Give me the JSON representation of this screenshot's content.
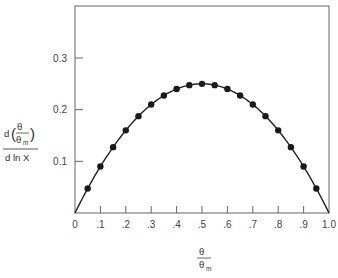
{
  "chart_data": {
    "type": "line",
    "title": "",
    "xlabel": "θ / θm",
    "ylabel": "d(θ/θm) / d ln X",
    "xlim": [
      0,
      1.0
    ],
    "ylim": [
      0,
      0.4
    ],
    "grid": false,
    "legend": null,
    "x_ticks": [
      "0",
      ".1",
      ".2",
      ".3",
      ".4",
      ".5",
      ".6",
      ".7",
      ".8",
      ".9",
      "1.0"
    ],
    "y_ticks": [
      "0.1",
      "0.2",
      "0.3"
    ],
    "series": [
      {
        "name": "theoretical curve",
        "style": "solid line",
        "x": [
          0,
          0.05,
          0.1,
          0.15,
          0.2,
          0.25,
          0.3,
          0.35,
          0.4,
          0.45,
          0.5,
          0.55,
          0.6,
          0.65,
          0.7,
          0.75,
          0.8,
          0.85,
          0.9,
          0.95,
          1.0
        ],
        "y": [
          0,
          0.0475,
          0.09,
          0.1275,
          0.16,
          0.1875,
          0.21,
          0.2275,
          0.24,
          0.2475,
          0.25,
          0.2475,
          0.24,
          0.2275,
          0.21,
          0.1875,
          0.16,
          0.1275,
          0.09,
          0.0475,
          0
        ]
      },
      {
        "name": "data points",
        "style": "filled circles",
        "x": [
          0.05,
          0.1,
          0.15,
          0.2,
          0.25,
          0.3,
          0.35,
          0.4,
          0.45,
          0.5,
          0.55,
          0.6,
          0.65,
          0.7,
          0.75,
          0.8,
          0.85,
          0.9,
          0.95
        ],
        "y": [
          0.0475,
          0.09,
          0.1275,
          0.16,
          0.1875,
          0.21,
          0.2275,
          0.24,
          0.2475,
          0.25,
          0.2475,
          0.24,
          0.2275,
          0.21,
          0.1875,
          0.16,
          0.1275,
          0.09,
          0.0475
        ]
      }
    ]
  },
  "labels": {
    "y_numer_d": "d",
    "y_theta": "θ",
    "y_theta_m": "θ",
    "y_m_sub": "m",
    "y_denom": "d ln X",
    "x_theta": "θ",
    "x_theta_m": "θ",
    "x_m_sub": "m"
  }
}
